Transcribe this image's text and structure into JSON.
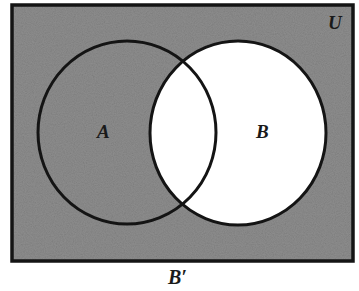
{
  "diagram": {
    "type": "venn",
    "universe_label": "U",
    "sets": [
      {
        "id": "A",
        "label": "A"
      },
      {
        "id": "B",
        "label": "B"
      }
    ],
    "shaded_region_label": "B′",
    "shaded_region_description": "complement of B (shaded): everything in U outside circle B",
    "colors": {
      "shaded_fill": "#8e8e8e",
      "unshaded_fill": "#ffffff",
      "stroke": "#141414",
      "background": "#ffffff"
    }
  },
  "labels": {
    "universe": "U",
    "set_a": "A",
    "set_b": "B",
    "caption": "B′"
  }
}
